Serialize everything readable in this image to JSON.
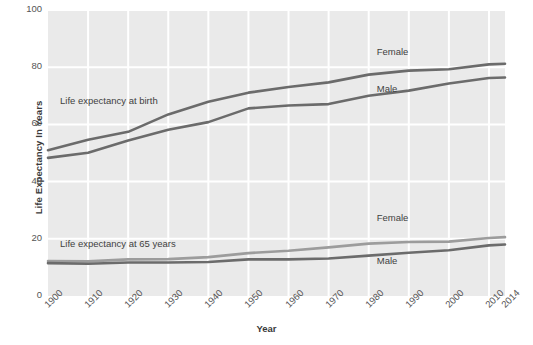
{
  "chart_data": {
    "type": "line",
    "title": "",
    "xlabel": "Year",
    "ylabel": "Life Expectancy In Years",
    "xlim": [
      1900,
      2014
    ],
    "ylim": [
      0,
      100
    ],
    "grid": true,
    "legend_position": "inline-annotations",
    "x": [
      1900,
      1910,
      1920,
      1930,
      1940,
      1950,
      1960,
      1970,
      1980,
      1990,
      2000,
      2010,
      2014
    ],
    "y_ticks": [
      0,
      20,
      40,
      60,
      80,
      100
    ],
    "x_tick_labels": [
      "1900",
      "1910",
      "1920",
      "1930",
      "1940",
      "1950",
      "1960",
      "1970",
      "1980",
      "1990",
      "2000",
      "2010",
      "2014"
    ],
    "annotations": [
      {
        "text": "Life expectancy at birth",
        "x": 1903,
        "y": 68
      },
      {
        "text": "Life expectancy at 65 years",
        "x": 1903,
        "y": 18
      }
    ],
    "series": [
      {
        "name": "Female",
        "group": "Life expectancy at birth",
        "label": "Female",
        "color": "#6b6b6b",
        "values": [
          51.0,
          54.6,
          57.4,
          63.5,
          67.9,
          71.1,
          73.1,
          74.7,
          77.4,
          78.8,
          79.3,
          81.0,
          81.2
        ]
      },
      {
        "name": "Male",
        "group": "Life expectancy at birth",
        "label": "Male",
        "color": "#6b6b6b",
        "values": [
          48.3,
          50.1,
          54.4,
          58.1,
          60.8,
          65.6,
          66.6,
          67.1,
          70.0,
          71.8,
          74.3,
          76.2,
          76.4
        ]
      },
      {
        "name": "Female",
        "group": "Life expectancy at 65 years",
        "label": "Female",
        "color": "#9c9c9c",
        "values": [
          12.2,
          12.1,
          12.8,
          12.9,
          13.6,
          15.0,
          15.8,
          17.0,
          18.3,
          18.9,
          19.0,
          20.3,
          20.6
        ]
      },
      {
        "name": "Male",
        "group": "Life expectancy at 65 years",
        "label": "Male",
        "color": "#6b6b6b",
        "values": [
          11.5,
          11.3,
          11.7,
          11.7,
          11.9,
          12.8,
          12.8,
          13.1,
          14.1,
          15.1,
          16.0,
          17.7,
          18.0
        ]
      }
    ],
    "series_labels": [
      {
        "text": "Female",
        "x": 1982,
        "y": 85
      },
      {
        "text": "Male",
        "x": 1982,
        "y": 72
      },
      {
        "text": "Female",
        "x": 1982,
        "y": 27
      },
      {
        "text": "Male",
        "x": 1982,
        "y": 12
      }
    ],
    "colors": {
      "plot_background": "#eaeaea",
      "gridline": "#ffffff",
      "page_background": "#ffffff",
      "dark_line": "#6b6b6b",
      "light_line": "#9c9c9c",
      "text": "#4a4a4a"
    }
  }
}
